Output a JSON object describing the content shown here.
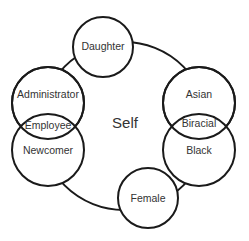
{
  "diagram": {
    "center_label": "Self",
    "nodes": {
      "daughter": "Daughter",
      "administrator": "Administrator",
      "employee": "Employee",
      "newcomer": "Newcomer",
      "asian": "Asian",
      "biracial": "Biracial",
      "black": "Black",
      "female": "Female"
    },
    "colors": {
      "stroke": "#1a1a1a",
      "text": "#333333",
      "background": "#ffffff"
    }
  }
}
